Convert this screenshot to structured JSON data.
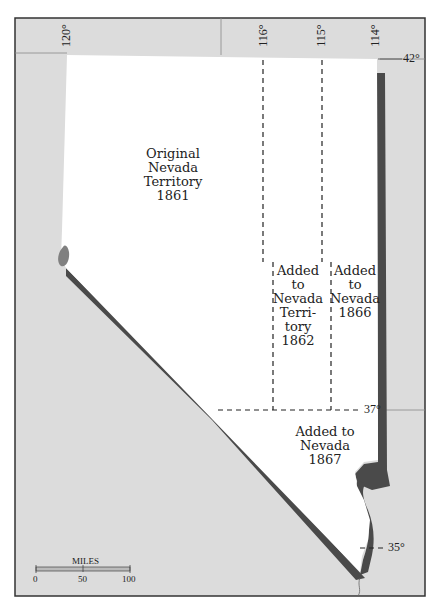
{
  "map": {
    "title": "Nevada territorial growth",
    "colors": {
      "land_outside": "#dcdcdc",
      "state": "#ffffff",
      "border_shadow": "#4a4a4a",
      "lake": "#808080",
      "frame": "#333333"
    },
    "regions": [
      {
        "id": "original",
        "lines": [
          "Original",
          "Nevada",
          "Territory",
          "1861"
        ]
      },
      {
        "id": "added1862",
        "lines": [
          "Added",
          "to",
          "Nevada",
          "Terri-",
          "tory",
          "1862"
        ]
      },
      {
        "id": "added1866",
        "lines": [
          "Added",
          "to",
          "Nevada",
          "1866"
        ]
      },
      {
        "id": "added1867",
        "lines": [
          "Added to",
          "Nevada",
          "1867"
        ]
      }
    ],
    "longitudes": [
      "120°",
      "116°",
      "115°",
      "114°"
    ],
    "latitudes": [
      "42°",
      "37°",
      "35°"
    ],
    "scale": {
      "label": "MILES",
      "ticks": [
        "0",
        "50",
        "100"
      ]
    }
  }
}
